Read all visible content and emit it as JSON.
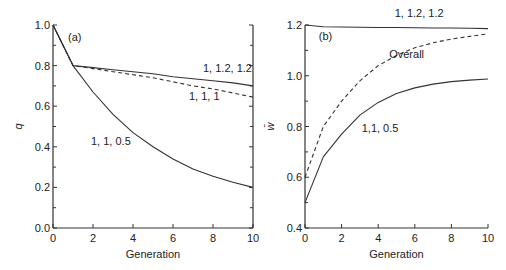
{
  "chart_data": [
    {
      "type": "line",
      "panel_label": "(a)",
      "title": "",
      "xlabel": "Generation",
      "ylabel": "q",
      "xlim": [
        0,
        10
      ],
      "ylim": [
        0.0,
        1.0
      ],
      "x_ticks": [
        0,
        2,
        4,
        6,
        8,
        10
      ],
      "x_tick_labels": [
        "0",
        "2",
        "4",
        "6",
        "8",
        "10"
      ],
      "y_ticks": [
        0.0,
        0.2,
        0.4,
        0.6,
        0.8,
        1.0
      ],
      "y_tick_labels": [
        "0.0",
        "0.2",
        "0.4",
        "0.6",
        "0.8",
        "1.0"
      ],
      "y_minor_ticks": [
        0.1,
        0.3,
        0.5,
        0.7,
        0.9
      ],
      "grid": false,
      "series": [
        {
          "name": "1, 1.2, 1.2",
          "style": "solid",
          "x": [
            0,
            1,
            2,
            3,
            4,
            5,
            6,
            7,
            8,
            9,
            10
          ],
          "y": [
            1.0,
            0.8,
            0.79,
            0.78,
            0.77,
            0.76,
            0.745,
            0.735,
            0.725,
            0.715,
            0.7
          ]
        },
        {
          "name": "1, 1, 1",
          "style": "dashed",
          "x": [
            0,
            1,
            2,
            3,
            4,
            5,
            6,
            7,
            8,
            9,
            10
          ],
          "y": [
            1.0,
            0.8,
            0.785,
            0.77,
            0.755,
            0.74,
            0.72,
            0.7,
            0.685,
            0.665,
            0.645
          ]
        },
        {
          "name": "1, 1, 0.5",
          "style": "solid",
          "x": [
            0,
            1,
            2,
            3,
            4,
            5,
            6,
            7,
            8,
            9,
            10
          ],
          "y": [
            1.0,
            0.8,
            0.67,
            0.56,
            0.47,
            0.4,
            0.34,
            0.29,
            0.255,
            0.225,
            0.2
          ]
        }
      ],
      "annotations": [
        {
          "text": "(a)",
          "x": 0.75,
          "y": 0.92
        },
        {
          "text": "1, 1.2, 1.2",
          "x": 7.5,
          "y": 0.77
        },
        {
          "text": "1, 1, 1",
          "x": 6.8,
          "y": 0.63
        },
        {
          "text": "1, 1, 0.5",
          "x": 1.9,
          "y": 0.41
        }
      ]
    },
    {
      "type": "line",
      "panel_label": "(b)",
      "title": "",
      "xlabel": "Generation",
      "ylabel": "w̄",
      "xlim": [
        0,
        10
      ],
      "ylim": [
        0.4,
        1.2
      ],
      "x_ticks": [
        0,
        2,
        4,
        6,
        8,
        10
      ],
      "x_tick_labels": [
        "0",
        "2",
        "4",
        "6",
        "8",
        "10"
      ],
      "y_ticks": [
        0.4,
        0.6,
        0.8,
        1.0,
        1.2
      ],
      "y_tick_labels": [
        "0.4",
        "0.6",
        "0.8",
        "1.0",
        "1.2"
      ],
      "y_minor_ticks": [
        0.5,
        0.7,
        0.9,
        1.1
      ],
      "grid": false,
      "series": [
        {
          "name": "1, 1.2, 1.2",
          "style": "solid",
          "x": [
            0,
            1,
            2,
            3,
            4,
            5,
            6,
            7,
            8,
            9,
            10
          ],
          "y": [
            1.2,
            1.193,
            1.192,
            1.191,
            1.19,
            1.19,
            1.189,
            1.188,
            1.188,
            1.187,
            1.186
          ]
        },
        {
          "name": "Overall",
          "style": "dashed",
          "x": [
            0,
            1,
            2,
            3,
            4,
            5,
            6,
            7,
            8,
            9,
            10
          ],
          "y": [
            0.6,
            0.8,
            0.9,
            0.98,
            1.04,
            1.08,
            1.11,
            1.13,
            1.145,
            1.155,
            1.165
          ]
        },
        {
          "name": "1,1, 0.5",
          "style": "solid",
          "x": [
            0,
            1,
            2,
            3,
            4,
            5,
            6,
            7,
            8,
            9,
            10
          ],
          "y": [
            0.5,
            0.68,
            0.77,
            0.845,
            0.895,
            0.93,
            0.952,
            0.967,
            0.977,
            0.983,
            0.987
          ]
        }
      ],
      "annotations": [
        {
          "text": "(b)",
          "x": 0.75,
          "y": 1.14
        },
        {
          "text": "1, 1.2, 1.2",
          "x": 4.9,
          "y": 1.23
        },
        {
          "text": "Overall",
          "x": 4.6,
          "y": 1.07
        },
        {
          "text": "1,1, 0.5",
          "x": 3.1,
          "y": 0.78
        }
      ]
    }
  ]
}
